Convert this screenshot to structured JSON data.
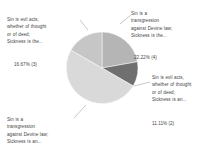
{
  "chart_data": {
    "type": "pie",
    "title": "",
    "legend_position": "none",
    "grid": false,
    "categories": [
      "Sin is a transgression against Devine law; Sickness is the...",
      "Sin is evil acts, whether of thought or of deed; Sickness is an...",
      "Sin is a transgression against Devine law; Sickness is an...",
      "Sin is evil acts, whether of thought or of deed; Sickness is the..."
    ],
    "values": [
      22.22,
      11.11,
      50.0,
      16.67
    ],
    "counts": [
      4,
      2,
      9,
      3
    ],
    "value_labels": [
      "22.22% (4)",
      "11.11% (2)",
      "",
      "16.67% (3)"
    ],
    "colors": [
      "#b5b5b5",
      "#6f6f6f",
      "#d9d9d9",
      "#c6c6c6"
    ]
  },
  "labels": {
    "top_left": {
      "text": "Sin is evil acts,\nwhether of thought\nor of deed;\nSickness is the...",
      "percent": "16.67% (3)"
    },
    "top_right": {
      "text": "Sin is a\ntransgression\nagainst Devine law;\nSickness is the...",
      "percent": "22.22% (4)"
    },
    "right": {
      "text": "Sin is evil acts,\nwhether of thought\nor of deed;\nSickness is an...",
      "percent": "11.11% (2)"
    },
    "bottom_left": {
      "text": "Sin is a\ntransgression\nagainst Devine law;\nSickness is an..."
    }
  }
}
